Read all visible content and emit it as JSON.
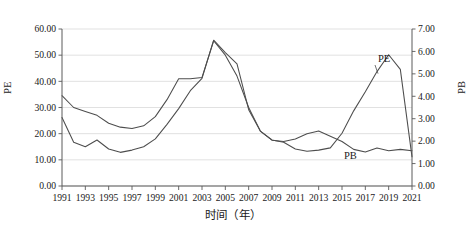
{
  "chart_data": {
    "type": "line",
    "title": "",
    "xlabel": "时间（年）",
    "ylabel": "PE",
    "y2label": "PB",
    "grid": true,
    "legend_position": "inline-annotation",
    "x": [
      1991,
      1992,
      1993,
      1994,
      1995,
      1996,
      1997,
      1998,
      1999,
      2000,
      2001,
      2002,
      2003,
      2004,
      2005,
      2006,
      2007,
      2008,
      2009,
      2010,
      2011,
      2012,
      2013,
      2014,
      2015,
      2016,
      2017,
      2018,
      2019,
      2020,
      2021
    ],
    "xlim": [
      1991,
      2021
    ],
    "xticks": [
      1991,
      1993,
      1995,
      1997,
      1999,
      2001,
      2003,
      2005,
      2007,
      2009,
      2011,
      2013,
      2015,
      2017,
      2019,
      2021
    ],
    "xticklabels": [
      "1991",
      "1993",
      "1995",
      "1997",
      "1999",
      "2001",
      "2003",
      "2005",
      "2007",
      "2009",
      "2011",
      "2013",
      "2015",
      "2017",
      "2019",
      "2021"
    ],
    "ylim": [
      0.0,
      60.0
    ],
    "yticks": [
      0.0,
      10.0,
      20.0,
      30.0,
      40.0,
      50.0,
      60.0
    ],
    "yticklabels": [
      "0.00",
      "10.00",
      "20.00",
      "30.00",
      "40.00",
      "50.00",
      "60.00"
    ],
    "y2lim": [
      0.0,
      7.0
    ],
    "y2ticks": [
      0.0,
      1.0,
      2.0,
      3.0,
      4.0,
      5.0,
      6.0,
      7.0
    ],
    "y2ticklabels": [
      "0.00",
      "1.00",
      "2.00",
      "3.00",
      "4.00",
      "5.00",
      "6.00",
      "7.00"
    ],
    "series": [
      {
        "name": "PE",
        "axis": "left",
        "annotation": "PE",
        "values": [
          34.5,
          30.0,
          28.5,
          27.0,
          24.0,
          22.5,
          22.0,
          23.0,
          26.5,
          33.0,
          41.0,
          41.0,
          41.5,
          55.5,
          50.0,
          42.0,
          30.0,
          21.0,
          17.5,
          17.0,
          18.0,
          20.0,
          21.0,
          19.0,
          17.0,
          14.0,
          13.0,
          14.5,
          13.5,
          14.0,
          13.5
        ]
      },
      {
        "name": "PB",
        "axis": "right",
        "annotation": "PB",
        "values": [
          3.05,
          1.95,
          1.75,
          2.05,
          1.65,
          1.5,
          1.6,
          1.75,
          2.1,
          2.75,
          3.45,
          4.25,
          4.8,
          6.5,
          5.95,
          5.45,
          3.4,
          2.45,
          2.05,
          1.95,
          1.65,
          1.55,
          1.6,
          1.7,
          2.35,
          3.35,
          4.2,
          5.1,
          5.85,
          5.2,
          1.3
        ]
      }
    ],
    "note_series_mapping": "Two grey line series plotted; PE read on left axis (0-60), PB read on right axis (0-7)"
  },
  "annotations": {
    "pe_label": "PE",
    "pb_label": "PB"
  },
  "axes": {
    "left_title": "PE",
    "right_title": "PB",
    "bottom_title": "时间（年）"
  },
  "colors": {
    "line": "#4d4d4d",
    "grid": "#d9d9d9",
    "axis": "#5a5a5a",
    "background": "#ffffff",
    "text": "#1a1a1a"
  }
}
